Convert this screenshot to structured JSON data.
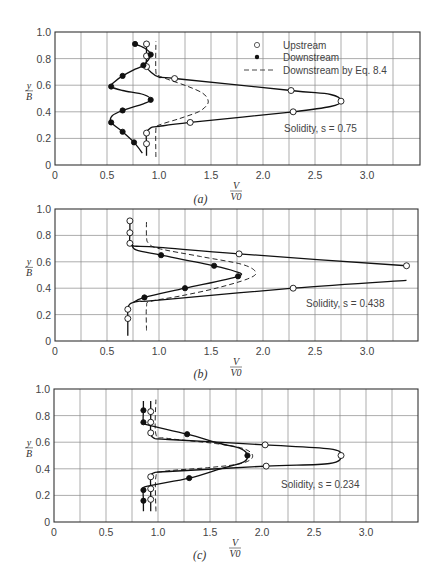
{
  "chart_data": [
    {
      "type": "line",
      "panel": "(a)",
      "xlabel": "V/V0",
      "ylabel": "y/B",
      "xlim": [
        0,
        3.5
      ],
      "ylim": [
        0,
        1.0
      ],
      "xticks": [
        "0",
        "0.5",
        "1.0",
        "1.5",
        "2.0",
        "2.5",
        "3.0"
      ],
      "yticks": [
        "0",
        "0.2",
        "0.4",
        "0.6",
        "0.8",
        "1.0"
      ],
      "grid": true,
      "legend": [
        "Upstream",
        "Downstream",
        "Downstream by Eq. 8.4"
      ],
      "annotation": "Solidity, s = 0.75",
      "series": [
        {
          "name": "Upstream",
          "marker": "open-circle",
          "points": [
            [
              0.88,
              0.91
            ],
            [
              0.88,
              0.82
            ],
            [
              0.88,
              0.74
            ],
            [
              1.15,
              0.65
            ],
            [
              2.27,
              0.56
            ],
            [
              2.75,
              0.48
            ],
            [
              2.29,
              0.4
            ],
            [
              1.3,
              0.32
            ],
            [
              0.88,
              0.24
            ],
            [
              0.88,
              0.16
            ]
          ],
          "curve": [
            [
              0.88,
              0.07
            ],
            [
              0.88,
              0.16
            ],
            [
              0.88,
              0.24
            ],
            [
              0.92,
              0.28
            ],
            [
              1.0,
              0.29
            ],
            [
              1.3,
              0.32
            ],
            [
              2.29,
              0.4
            ],
            [
              2.65,
              0.44
            ],
            [
              2.75,
              0.48
            ],
            [
              2.65,
              0.53
            ],
            [
              2.27,
              0.56
            ],
            [
              1.15,
              0.65
            ],
            [
              1.0,
              0.66
            ],
            [
              0.92,
              0.7
            ],
            [
              0.88,
              0.74
            ],
            [
              0.88,
              0.82
            ],
            [
              0.88,
              0.91
            ]
          ]
        },
        {
          "name": "Downstream",
          "marker": "filled-circle",
          "points": [
            [
              0.77,
              0.91
            ],
            [
              0.92,
              0.83
            ],
            [
              0.85,
              0.75
            ],
            [
              0.65,
              0.67
            ],
            [
              0.54,
              0.59
            ],
            [
              0.92,
              0.49
            ],
            [
              0.65,
              0.41
            ],
            [
              0.54,
              0.32
            ],
            [
              0.65,
              0.25
            ],
            [
              0.76,
              0.17
            ]
          ],
          "curve": [
            [
              0.84,
              0.09
            ],
            [
              0.76,
              0.17
            ],
            [
              0.65,
              0.25
            ],
            [
              0.54,
              0.32
            ],
            [
              0.55,
              0.37
            ],
            [
              0.65,
              0.41
            ],
            [
              0.85,
              0.46
            ],
            [
              0.92,
              0.49
            ],
            [
              0.85,
              0.53
            ],
            [
              0.65,
              0.56
            ],
            [
              0.54,
              0.59
            ],
            [
              0.58,
              0.63
            ],
            [
              0.65,
              0.67
            ],
            [
              0.77,
              0.72
            ],
            [
              0.85,
              0.75
            ],
            [
              0.92,
              0.83
            ],
            [
              0.86,
              0.88
            ],
            [
              0.77,
              0.91
            ]
          ]
        },
        {
          "name": "Downstream by Eq. 8.4",
          "style": "dashed",
          "curve": [
            [
              0.97,
              0.06
            ],
            [
              0.97,
              0.27
            ],
            [
              1.0,
              0.3
            ],
            [
              1.2,
              0.35
            ],
            [
              1.38,
              0.4
            ],
            [
              1.46,
              0.45
            ],
            [
              1.47,
              0.49
            ],
            [
              1.42,
              0.54
            ],
            [
              1.28,
              0.59
            ],
            [
              1.1,
              0.64
            ],
            [
              1.0,
              0.67
            ],
            [
              0.97,
              0.7
            ],
            [
              0.97,
              0.93
            ]
          ]
        }
      ]
    },
    {
      "type": "line",
      "panel": "(b)",
      "xlabel": "V/V0",
      "ylabel": "y/B",
      "xlim": [
        0,
        3.5
      ],
      "ylim": [
        0,
        1.0
      ],
      "xticks": [
        "0",
        "0.5",
        "1.0",
        "1.5",
        "2.0",
        "2.5",
        "3.0"
      ],
      "yticks": [
        "0",
        "0.2",
        "0.4",
        "0.6",
        "0.8",
        "1.0"
      ],
      "grid": true,
      "annotation": "Solidity, s = 0.438",
      "series": [
        {
          "name": "Upstream",
          "marker": "open-circle",
          "points": [
            [
              0.72,
              0.91
            ],
            [
              0.72,
              0.82
            ],
            [
              0.72,
              0.74
            ],
            [
              1.77,
              0.66
            ],
            [
              3.38,
              0.57
            ],
            [
              2.29,
              0.4
            ],
            [
              0.7,
              0.24
            ],
            [
              0.7,
              0.17
            ]
          ],
          "curve": [
            [
              0.7,
              0.04
            ],
            [
              0.7,
              0.17
            ],
            [
              0.7,
              0.24
            ],
            [
              0.72,
              0.28
            ],
            [
              0.8,
              0.3
            ],
            [
              1.0,
              0.31
            ],
            [
              2.29,
              0.4
            ],
            [
              3.38,
              0.46
            ]
          ],
          "curve2": [
            [
              3.38,
              0.57
            ],
            [
              1.77,
              0.66
            ],
            [
              1.0,
              0.71
            ],
            [
              0.76,
              0.72
            ],
            [
              0.72,
              0.74
            ],
            [
              0.72,
              0.82
            ],
            [
              0.72,
              0.91
            ]
          ]
        },
        {
          "name": "Downstream",
          "marker": "filled-circle",
          "points": [
            [
              1.02,
              0.65
            ],
            [
              1.53,
              0.57
            ],
            [
              1.76,
              0.49
            ],
            [
              1.25,
              0.4
            ],
            [
              0.86,
              0.33
            ]
          ],
          "curve": [
            [
              0.74,
              0.73
            ],
            [
              0.78,
              0.69
            ],
            [
              1.02,
              0.65
            ],
            [
              1.53,
              0.57
            ],
            [
              1.72,
              0.53
            ],
            [
              1.76,
              0.49
            ],
            [
              1.25,
              0.4
            ],
            [
              0.86,
              0.33
            ],
            [
              0.75,
              0.29
            ]
          ]
        },
        {
          "name": "Downstream by Eq. 8.4",
          "style": "dashed",
          "curve": [
            [
              0.88,
              0.08
            ],
            [
              0.88,
              0.26
            ],
            [
              0.92,
              0.3
            ],
            [
              1.2,
              0.34
            ],
            [
              1.55,
              0.4
            ],
            [
              1.85,
              0.47
            ],
            [
              1.93,
              0.52
            ],
            [
              1.8,
              0.58
            ],
            [
              1.4,
              0.64
            ],
            [
              1.0,
              0.7
            ],
            [
              0.9,
              0.74
            ],
            [
              0.88,
              0.79
            ],
            [
              0.88,
              0.92
            ]
          ]
        }
      ]
    },
    {
      "type": "line",
      "panel": "(c)",
      "xlabel": "V/V0",
      "ylabel": "y/B",
      "xlim": [
        0,
        3.5
      ],
      "ylim": [
        0,
        1.0
      ],
      "xticks": [
        "0",
        "0.5",
        "1.0",
        "1.5",
        "2.0",
        "2.5",
        "3.0"
      ],
      "yticks": [
        "0",
        "0.2",
        "0.4",
        "0.6",
        "0.8",
        "1.0"
      ],
      "grid": true,
      "annotation": "Solidity, s = 0.234",
      "series": [
        {
          "name": "Upstream",
          "marker": "open-circle",
          "points": [
            [
              0.93,
              0.83
            ],
            [
              0.93,
              0.75
            ],
            [
              0.93,
              0.67
            ],
            [
              2.03,
              0.58
            ],
            [
              2.76,
              0.5
            ],
            [
              2.04,
              0.42
            ],
            [
              0.93,
              0.34
            ],
            [
              0.93,
              0.25
            ],
            [
              0.93,
              0.17
            ]
          ],
          "curve": [
            [
              0.93,
              0.08
            ],
            [
              0.93,
              0.17
            ],
            [
              0.93,
              0.25
            ],
            [
              0.93,
              0.34
            ],
            [
              0.96,
              0.37
            ],
            [
              1.1,
              0.38
            ],
            [
              2.04,
              0.42
            ],
            [
              2.65,
              0.44
            ],
            [
              2.76,
              0.5
            ],
            [
              2.65,
              0.55
            ],
            [
              2.03,
              0.58
            ],
            [
              1.1,
              0.62
            ],
            [
              0.96,
              0.63
            ],
            [
              0.93,
              0.67
            ],
            [
              0.93,
              0.75
            ],
            [
              0.93,
              0.83
            ],
            [
              0.93,
              0.91
            ]
          ]
        },
        {
          "name": "Downstream",
          "marker": "filled-circle",
          "points": [
            [
              0.86,
              0.84
            ],
            [
              0.86,
              0.75
            ],
            [
              1.28,
              0.66
            ],
            [
              1.86,
              0.5
            ],
            [
              1.3,
              0.33
            ],
            [
              0.86,
              0.24
            ],
            [
              0.86,
              0.16
            ]
          ],
          "curve": [
            [
              0.86,
              0.08
            ],
            [
              0.86,
              0.16
            ],
            [
              0.86,
              0.24
            ],
            [
              0.9,
              0.27
            ],
            [
              1.3,
              0.33
            ],
            [
              1.6,
              0.4
            ],
            [
              1.82,
              0.45
            ],
            [
              1.86,
              0.5
            ],
            [
              1.8,
              0.55
            ],
            [
              1.6,
              0.59
            ],
            [
              1.28,
              0.66
            ],
            [
              0.9,
              0.73
            ],
            [
              0.86,
              0.75
            ],
            [
              0.86,
              0.84
            ],
            [
              0.86,
              0.91
            ]
          ]
        },
        {
          "name": "Downstream by Eq. 8.4",
          "style": "dashed",
          "curve": [
            [
              0.98,
              0.08
            ],
            [
              0.98,
              0.34
            ],
            [
              1.05,
              0.38
            ],
            [
              1.5,
              0.41
            ],
            [
              1.8,
              0.44
            ],
            [
              1.91,
              0.49
            ],
            [
              1.83,
              0.55
            ],
            [
              1.55,
              0.59
            ],
            [
              1.08,
              0.63
            ],
            [
              0.98,
              0.66
            ],
            [
              0.98,
              0.92
            ]
          ]
        }
      ]
    }
  ],
  "panels": {
    "a": {
      "caption": "(a)",
      "annotation": "Solidity, s = 0.75"
    },
    "b": {
      "caption": "(b)",
      "annotation": "Solidity, s = 0.438"
    },
    "c": {
      "caption": "(c)",
      "annotation": "Solidity, s = 0.234"
    }
  },
  "legend": {
    "upstream": "Upstream",
    "downstream": "Downstream",
    "eq": "Downstream by Eq. 8.4"
  },
  "axis": {
    "x_num": "V",
    "x_den": "V0",
    "y_num": "y",
    "y_den": "B"
  }
}
